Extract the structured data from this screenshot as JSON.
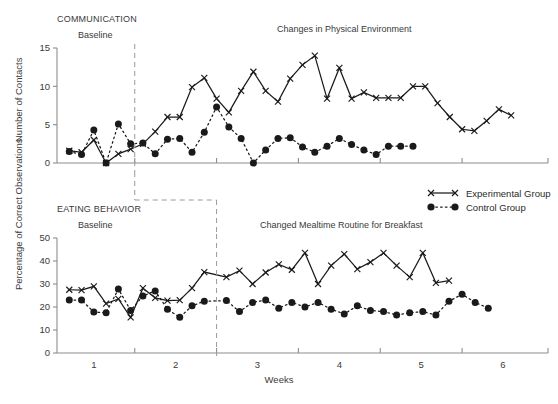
{
  "figure": {
    "xlabel": "Weeks",
    "x_tick_labels": [
      "1",
      "2",
      "3",
      "4",
      "5",
      "6"
    ],
    "x_tick_values": [
      1,
      2,
      3,
      4,
      5,
      6
    ],
    "x_minor_ticks": [
      1.5,
      2.5,
      3.5,
      4.5,
      5.5
    ],
    "xlim": [
      0.55,
      6.55
    ]
  },
  "legend": {
    "position": "right-middle",
    "items": [
      {
        "label": "Experimental Group",
        "marker": "x",
        "line": "solid",
        "color": "#1a1a1a"
      },
      {
        "label": "Control Group",
        "marker": "circle",
        "line": "dotted",
        "color": "#1a1a1a"
      }
    ]
  },
  "chart_data": [
    {
      "type": "line",
      "panel": "top",
      "title": "COMMUNICATION",
      "ylabel": "Number of Contacts",
      "xlabel": "",
      "ylim": [
        0,
        15
      ],
      "y_ticks": [
        0,
        5,
        10,
        15
      ],
      "grid": false,
      "phase_labels": [
        {
          "text": "Baseline",
          "x": 1.05
        },
        {
          "text": "Changes in Physical Environment",
          "x": 3.65
        }
      ],
      "phase_change_x": 1.5,
      "series": [
        {
          "name": "Experimental Group",
          "marker": "x",
          "line": "solid",
          "x": [
            0.7,
            0.85,
            1.0,
            1.15,
            1.3,
            1.45,
            1.6,
            1.75,
            1.9,
            2.05,
            2.2,
            2.35,
            2.5,
            2.65,
            2.8,
            2.95,
            3.1,
            3.25,
            3.4,
            3.55,
            3.7,
            3.85,
            4.0,
            4.15,
            4.3,
            4.45,
            4.6,
            4.75,
            4.9,
            5.05,
            5.2,
            5.35,
            5.5,
            5.65,
            5.8,
            5.95,
            6.1,
            6.25,
            6.4
          ],
          "y": [
            1.6,
            1.4,
            3.0,
            0.0,
            1.2,
            1.8,
            2.5,
            4.1,
            6.0,
            6.0,
            9.9,
            11.1,
            8.4,
            6.6,
            9.4,
            11.9,
            9.4,
            8.0,
            11.0,
            12.8,
            14.0,
            8.4,
            12.4,
            8.4,
            9.2,
            8.5,
            8.5,
            8.5,
            10.0,
            10.0,
            7.8,
            6.0,
            4.4,
            4.2,
            5.5,
            7.0,
            6.2
          ]
        },
        {
          "name": "Control Group",
          "marker": "circle",
          "line": "dotted",
          "x": [
            0.7,
            0.85,
            1.0,
            1.15,
            1.3,
            1.45,
            1.6,
            1.75,
            1.9,
            2.05,
            2.2,
            2.35,
            2.5,
            2.65,
            2.8,
            2.95,
            3.1,
            3.25,
            3.4,
            3.55,
            3.7,
            3.85,
            4.0,
            4.15,
            4.3,
            4.45,
            4.6,
            4.75,
            4.9,
            5.05,
            5.2,
            5.35,
            5.5,
            5.65,
            5.8,
            5.95,
            6.1,
            6.25,
            6.4
          ],
          "y": [
            1.5,
            1.1,
            4.3,
            0.0,
            5.1,
            2.5,
            2.6,
            1.2,
            3.1,
            3.2,
            1.4,
            4.0,
            7.3,
            4.7,
            3.2,
            0.0,
            1.7,
            3.2,
            3.3,
            2.1,
            1.4,
            2.2,
            3.2,
            2.4,
            1.7,
            1.1,
            2.2,
            2.2,
            2.2
          ]
        }
      ]
    },
    {
      "type": "line",
      "panel": "bottom",
      "title": "EATING BEHAVIOR",
      "ylabel": "Percentage of Correct Observations",
      "xlabel": "Weeks",
      "ylim": [
        0,
        50
      ],
      "y_ticks": [
        0,
        10,
        20,
        30,
        40,
        50
      ],
      "grid": false,
      "phase_labels": [
        {
          "text": "Baseline",
          "x": 1.05
        },
        {
          "text": "Changed Mealtime Routine for Breakfast",
          "x": 4.05
        }
      ],
      "phase_change_x": 2.5,
      "series": [
        {
          "name": "Experimental Group",
          "marker": "x",
          "line": "solid",
          "x": [
            0.7,
            0.85,
            1.0,
            1.15,
            1.3,
            1.45,
            1.6,
            1.75,
            1.9,
            2.05,
            2.2,
            2.35,
            2.62,
            2.78,
            2.94,
            3.1,
            3.26,
            3.42,
            3.58,
            3.74,
            3.9,
            4.06,
            4.22,
            4.38,
            4.54,
            4.7,
            4.86,
            5.02,
            5.18,
            5.34,
            5.5,
            5.66,
            5.82,
            5.98,
            6.14,
            6.3
          ],
          "y": [
            27.5,
            27.3,
            29.0,
            21.5,
            23.5,
            15.5,
            28.2,
            24.0,
            22.8,
            23.0,
            28.2,
            35.2,
            33.0,
            35.8,
            30.0,
            35.0,
            38.5,
            36.2,
            43.5,
            30.0,
            38.0,
            43.0,
            36.5,
            39.5,
            43.5,
            38.0,
            33.0,
            43.5,
            30.5,
            31.5
          ]
        },
        {
          "name": "Control Group",
          "marker": "circle",
          "line": "dotted",
          "x": [
            0.7,
            0.85,
            1.0,
            1.15,
            1.3,
            1.45,
            1.6,
            1.75,
            1.9,
            2.05,
            2.2,
            2.35,
            2.62,
            2.78,
            2.94,
            3.1,
            3.26,
            3.42,
            3.58,
            3.74,
            3.9,
            4.06,
            4.22,
            4.38,
            4.54,
            4.7,
            4.86,
            5.02,
            5.18,
            5.34,
            5.5,
            5.66,
            5.82,
            5.98,
            6.14,
            6.3
          ],
          "y": [
            23.0,
            23.0,
            17.8,
            17.5,
            27.8,
            18.5,
            24.8,
            27.0,
            19.0,
            15.5,
            20.5,
            22.5,
            22.8,
            18.0,
            22.0,
            23.0,
            19.5,
            22.0,
            20.0,
            22.0,
            19.0,
            17.0,
            20.5,
            18.5,
            18.0,
            16.5,
            17.5,
            18.0,
            16.5,
            22.5,
            25.5,
            22.0,
            19.5
          ]
        }
      ]
    }
  ]
}
